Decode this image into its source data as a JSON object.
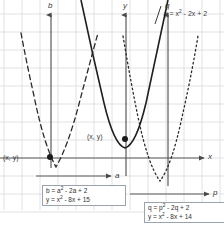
{
  "figure": {
    "type": "graph",
    "background": "#ffffff",
    "grid_color": "#d5d9de",
    "axis_color": "#555555",
    "curve_color": "#2b2b2b",
    "grid_spacing": 18
  },
  "axes": [
    {
      "name": "x-axis-horizontal",
      "label": "x",
      "orientation": "horizontal",
      "label_x": 209,
      "label_y": 160
    },
    {
      "name": "a-axis-horizontal",
      "label": "a",
      "orientation": "horizontal",
      "label_x": 116,
      "label_y": 179
    },
    {
      "name": "p-axis-horizontal",
      "label": "p",
      "orientation": "horizontal",
      "label_x": 214,
      "label_y": 193
    },
    {
      "name": "b-axis-vertical",
      "label": "b",
      "orientation": "vertical",
      "label_x": 49,
      "label_y": 3
    },
    {
      "name": "y-axis-vertical",
      "label": "y",
      "orientation": "vertical",
      "label_x": 124,
      "label_y": 3
    },
    {
      "name": "q-axis-vertical",
      "label": "q",
      "orientation": "vertical",
      "label_x": 166,
      "label_y": 3
    }
  ],
  "curves": [
    {
      "name": "solid-parabola",
      "style": "solid",
      "equation_label": "y = x² - 2x + 2",
      "vertex": {
        "x": 125,
        "y": 148
      }
    },
    {
      "name": "dashed-parabola-left",
      "style": "dashed",
      "equation_label": "y = x² - 8x + 15",
      "vertex": {
        "x": 56,
        "y": 168
      }
    },
    {
      "name": "dotted-parabola-right",
      "style": "dotted",
      "equation_label": "y = x² - 8x + 14",
      "vertex": {
        "x": 160,
        "y": 182
      }
    }
  ],
  "main_equation": {
    "label": "y = x² - 2x + 2",
    "base": "y = x",
    "exp": "2",
    "rest": " - 2x + 2"
  },
  "points": [
    {
      "name": "point-label-left",
      "label": "(x, y)",
      "x": 4,
      "y": 157
    },
    {
      "name": "point-label-center",
      "label": "(x, y)",
      "x": 88,
      "y": 137
    }
  ],
  "equation_boxes": [
    {
      "name": "equation-box-left",
      "line1": {
        "pre": "b = a",
        "exp": "2",
        "post": " - 2a + 2"
      },
      "line2": {
        "pre": "y = x",
        "exp": "2",
        "post": " - 8x + 15"
      },
      "line1_text": "b = a² - 2a + 2",
      "line2_text": "y = x² - 8x + 15"
    },
    {
      "name": "equation-box-right",
      "line1": {
        "pre": "q = p",
        "exp": "2",
        "post": " - 2q + 2"
      },
      "line2": {
        "pre": "y = x",
        "exp": "2",
        "post": " - 8x + 14"
      },
      "line1_text": "q = p² - 2q + 2",
      "line2_text": "y = x² - 8x + 14"
    }
  ]
}
